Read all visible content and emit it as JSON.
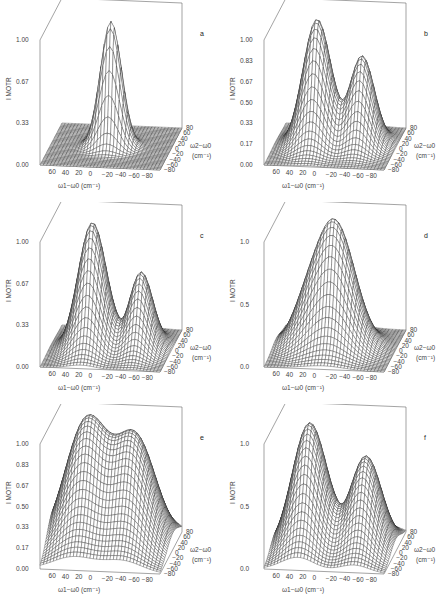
{
  "figure": {
    "panels": [
      "a",
      "b",
      "c",
      "d",
      "e",
      "f"
    ]
  },
  "chart_data": [
    {
      "panel": "a",
      "type": "surface3d",
      "zlabel": "I MOTR",
      "xlabel": "ω1−ω0 (cm⁻¹)",
      "ylabel": "ω2−ω0 (cm⁻¹)",
      "zticks": [
        "0.00",
        "0.33",
        "0.67",
        "1.00"
      ],
      "xticks": [
        "60",
        "40",
        "20",
        "0",
        "−20",
        "−40",
        "−60",
        "−80"
      ],
      "yticks": [
        "80",
        "60",
        "40",
        "20",
        "0",
        "−20",
        "−40",
        "−60",
        "−80"
      ],
      "zlim": [
        0,
        1
      ],
      "xlim": [
        80,
        -80
      ],
      "ylim": [
        -80,
        80
      ],
      "peaks": [
        {
          "x": 0,
          "y": 0,
          "height": 1.0,
          "sx": 14,
          "sy": 14
        }
      ]
    },
    {
      "panel": "b",
      "type": "surface3d",
      "zlabel": "I MOTR",
      "xlabel": "ω1−ω0 (cm⁻¹)",
      "ylabel": "ω2−ω0 (cm⁻¹)",
      "zticks": [
        "0.00",
        "0.17",
        "0.33",
        "0.50",
        "0.67",
        "0.83",
        "1.00"
      ],
      "xticks": [
        "60",
        "40",
        "20",
        "0",
        "−20",
        "−40",
        "−60",
        "−80"
      ],
      "yticks": [
        "80",
        "60",
        "40",
        "20",
        "0",
        "−20",
        "−40",
        "−60",
        "−80"
      ],
      "zlim": [
        0,
        1
      ],
      "xlim": [
        80,
        -80
      ],
      "ylim": [
        -80,
        80
      ],
      "peaks": [
        {
          "x": 25,
          "y": 5,
          "height": 1.0,
          "sx": 18,
          "sy": 28
        },
        {
          "x": -35,
          "y": 5,
          "height": 0.72,
          "sx": 16,
          "sy": 26
        }
      ]
    },
    {
      "panel": "c",
      "type": "surface3d",
      "zlabel": "I MOTR",
      "xlabel": "ω1−ω0 (cm⁻¹)",
      "ylabel": "ω2−ω0 (cm⁻¹)",
      "zticks": [
        "0.00",
        "0.33",
        "0.67",
        "1.00"
      ],
      "xticks": [
        "60",
        "40",
        "20",
        "0",
        "−20",
        "−40",
        "−60",
        "−80"
      ],
      "yticks": [
        "80",
        "60",
        "40",
        "20",
        "0",
        "−20",
        "−40",
        "−60",
        "−80"
      ],
      "zlim": [
        0,
        1
      ],
      "xlim": [
        80,
        -80
      ],
      "ylim": [
        -80,
        80
      ],
      "peaks": [
        {
          "x": 25,
          "y": 0,
          "height": 1.0,
          "sx": 18,
          "sy": 30
        },
        {
          "x": -40,
          "y": 0,
          "height": 0.62,
          "sx": 15,
          "sy": 28
        }
      ]
    },
    {
      "panel": "d",
      "type": "surface3d",
      "zlabel": "I MOTR",
      "xlabel": "ω1−ω0 (cm⁻¹)",
      "ylabel": "ω2−ω0 (cm⁻¹)",
      "zticks": [
        "0.0",
        "0.5",
        "1.0"
      ],
      "xticks": [
        "60",
        "40",
        "20",
        "0",
        "−20",
        "−40",
        "−60",
        "−80"
      ],
      "yticks": [
        "80",
        "60",
        "40",
        "20",
        "0",
        "−20",
        "−40",
        "−60",
        "−80"
      ],
      "zlim": [
        0,
        1
      ],
      "xlim": [
        80,
        -80
      ],
      "ylim": [
        -80,
        80
      ],
      "peaks": [
        {
          "x": 0,
          "y": 0,
          "height": 1.0,
          "sx": 26,
          "sy": 30
        },
        {
          "x": 40,
          "y": 10,
          "height": 0.25,
          "sx": 20,
          "sy": 30
        }
      ]
    },
    {
      "panel": "e",
      "type": "surface3d",
      "zlabel": "I MOTR",
      "xlabel": "ω1−ω0 (cm⁻¹)",
      "ylabel": "ω2−ω0 (cm⁻¹)",
      "zticks": [
        "0.00",
        "0.17",
        "0.33",
        "0.50",
        "0.67",
        "0.83",
        "1.00"
      ],
      "xticks": [
        "60",
        "40",
        "20",
        "0",
        "−20",
        "−40",
        "−60",
        "−80"
      ],
      "yticks": [
        "80",
        "60",
        "40",
        "20",
        "0",
        "−20",
        "−40",
        "−60",
        "−80"
      ],
      "zlim": [
        0,
        1
      ],
      "xlim": [
        80,
        -80
      ],
      "ylim": [
        -80,
        80
      ],
      "peaks": [
        {
          "x": 35,
          "y": 15,
          "height": 1.0,
          "sx": 28,
          "sy": 45
        },
        {
          "x": -30,
          "y": 15,
          "height": 0.85,
          "sx": 26,
          "sy": 45
        }
      ]
    },
    {
      "panel": "f",
      "type": "surface3d",
      "zlabel": "I MOTR",
      "xlabel": "ω1−ω0 (cm⁻¹)",
      "ylabel": "ω2−ω0 (cm⁻¹)",
      "zticks": [
        "0.0",
        "0.5",
        "1.0"
      ],
      "xticks": [
        "60",
        "40",
        "20",
        "0",
        "−20",
        "−40",
        "−60",
        "−80"
      ],
      "yticks": [
        "80",
        "60",
        "40",
        "20",
        "0",
        "−20",
        "−40",
        "−60",
        "−80"
      ],
      "zlim": [
        0,
        1
      ],
      "xlim": [
        80,
        -80
      ],
      "ylim": [
        -80,
        80
      ],
      "peaks": [
        {
          "x": 35,
          "y": 5,
          "height": 1.0,
          "sx": 22,
          "sy": 40
        },
        {
          "x": -40,
          "y": 5,
          "height": 0.75,
          "sx": 20,
          "sy": 38
        }
      ]
    }
  ]
}
